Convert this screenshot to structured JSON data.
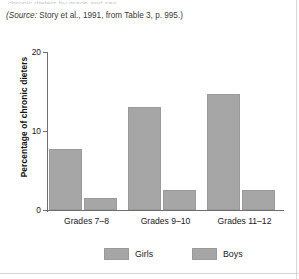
{
  "caption": {
    "source_prefix": "(Source:",
    "source_text": " Story et al., 1991, from Table 3, p. 995.)",
    "cut_off_line": "chronic dieters by grade and sex"
  },
  "chart_data": {
    "type": "bar",
    "title": "",
    "xlabel": "",
    "ylabel": "Percentage of chronic dieters",
    "categories": [
      "Grades 7–8",
      "Grades 9–10",
      "Grades 11–12"
    ],
    "series": [
      {
        "name": "Girls",
        "values": [
          7.7,
          13.0,
          14.7
        ],
        "color": "#a6a6a6"
      },
      {
        "name": "Boys",
        "values": [
          1.5,
          2.5,
          2.5
        ],
        "color": "#a6a6a6"
      }
    ],
    "ylim": [
      0,
      20
    ],
    "yticks": [
      0,
      10,
      20
    ],
    "ytick_labels": [
      "0",
      "10",
      "20"
    ],
    "grid": false,
    "legend_position": "bottom"
  },
  "legend": {
    "items": [
      {
        "label": "Girls"
      },
      {
        "label": "Boys"
      }
    ]
  },
  "colors": {
    "bar_fill": "#a6a6a6",
    "bar_stroke": "#9a9a9a",
    "axis": "#6e6e6e",
    "text": "#1a1a1a",
    "page_background": "#ffffff"
  }
}
